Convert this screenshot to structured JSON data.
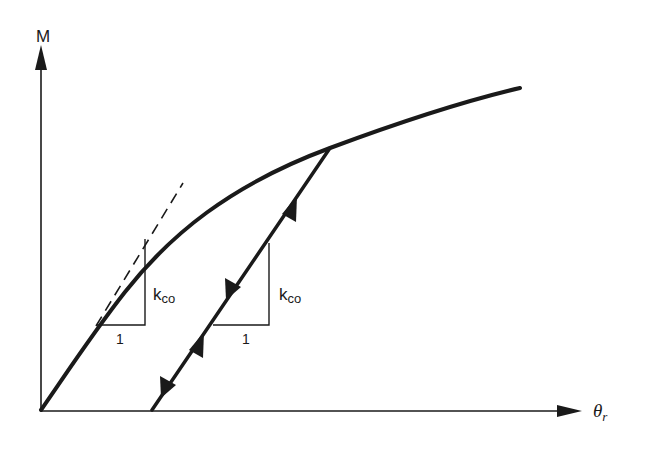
{
  "diagram": {
    "type": "moment-rotation connection curve",
    "colors": {
      "ink": "#1a1a1a",
      "background": "#ffffff"
    },
    "axes": {
      "y_label": "M",
      "x_label": "θ",
      "x_label_subscript": "r"
    },
    "annotations": {
      "initial_stiffness": {
        "label_main": "k",
        "label_sub": "co",
        "run_label": "1"
      },
      "unloading_stiffness": {
        "label_main": "k",
        "label_sub": "co",
        "run_label": "1"
      }
    },
    "elements": [
      "nonlinear loading curve M-θr from origin",
      "dashed tangent at origin (initial stiffness)",
      "unloading/reloading straight line parallel to tangent with arrows",
      "slope triangles labelled kco over 1"
    ]
  }
}
